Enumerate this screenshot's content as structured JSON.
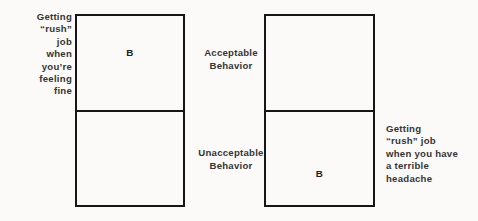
{
  "figure": {
    "background_color": "#fbfaf8",
    "line_color": "#161616",
    "text_color": "#353535"
  },
  "captions": {
    "left": "Getting\n“rush”\njob\nwhen\nyou’re\nfeeling\nfine",
    "right": "Getting\n“rush” job\nwhen you have\na terrible\nheadache"
  },
  "center_labels": {
    "acceptable": "Acceptable\nBehavior",
    "unacceptable": "Unacceptable\nBehavior"
  },
  "matrix": {
    "left_box": {
      "top_cell": {
        "mark": "B"
      },
      "bottom_cell": {
        "mark": ""
      }
    },
    "right_box": {
      "top_cell": {
        "mark": ""
      },
      "bottom_cell": {
        "mark": "B"
      }
    }
  }
}
